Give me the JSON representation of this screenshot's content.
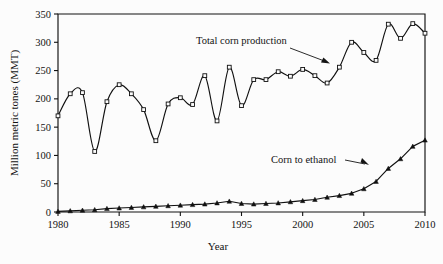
{
  "chart_data": {
    "type": "line",
    "title": "",
    "xlabel": "Year",
    "ylabel": "Million metric tones (MMT)",
    "xlim": [
      1980,
      2010
    ],
    "ylim": [
      0,
      350
    ],
    "grid": false,
    "legend_position": "inline-annotations",
    "x_ticks": [
      "1980",
      "1985",
      "1990",
      "1995",
      "2000",
      "2005",
      "2010"
    ],
    "x_tick_values": [
      1980,
      1985,
      1990,
      1995,
      2000,
      2005,
      2010
    ],
    "y_ticks": [
      "0",
      "50",
      "100",
      "150",
      "200",
      "250",
      "300",
      "350"
    ],
    "y_tick_values": [
      0,
      50,
      100,
      150,
      200,
      250,
      300,
      350
    ],
    "x": [
      1980,
      1981,
      1982,
      1983,
      1984,
      1985,
      1986,
      1987,
      1988,
      1989,
      1990,
      1991,
      1992,
      1993,
      1994,
      1995,
      1996,
      1997,
      1998,
      1999,
      2000,
      2001,
      2002,
      2003,
      2004,
      2005,
      2006,
      2007,
      2008,
      2009,
      2010
    ],
    "series": [
      {
        "name": "Total corn production",
        "marker": "open-square",
        "values": [
          170,
          209,
          211,
          107,
          195,
          225,
          209,
          181,
          126,
          191,
          202,
          190,
          241,
          161,
          256,
          188,
          234,
          234,
          248,
          240,
          252,
          241,
          228,
          256,
          300,
          282,
          268,
          332,
          307,
          333,
          316
        ]
      },
      {
        "name": "Corn to ethanol",
        "marker": "filled-triangle",
        "values": [
          1,
          2,
          3,
          4,
          6,
          7,
          8,
          9,
          10,
          11,
          12,
          13,
          14,
          16,
          19,
          15,
          14,
          15,
          16,
          18,
          20,
          22,
          26,
          29,
          33,
          41,
          54,
          77,
          94,
          116,
          127
        ]
      }
    ],
    "annotations": [
      {
        "text": "Total corn production",
        "points_to_series": "Total corn production",
        "points_to_x": 2002
      },
      {
        "text": "Corn to ethanol",
        "points_to_series": "Corn to ethanol",
        "points_to_x": 2007
      }
    ]
  }
}
